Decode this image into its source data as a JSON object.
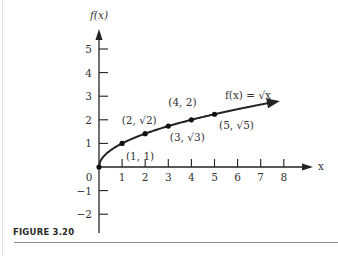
{
  "figure": {
    "caption": "FIGURE 3.20"
  },
  "chart_data": {
    "type": "line",
    "title": "",
    "function_label": "f(x) = √x",
    "xlabel": "x",
    "ylabel": "f(x)",
    "x_ticks": [
      "1",
      "2",
      "3",
      "4",
      "5",
      "6",
      "7",
      "8"
    ],
    "y_ticks": [
      "−2",
      "−1",
      "1",
      "2",
      "3",
      "4",
      "5"
    ],
    "origin_label": "0",
    "xlim": [
      0,
      9
    ],
    "ylim": [
      -3,
      6
    ],
    "grid": false,
    "series": [
      {
        "name": "f(x) = √x",
        "x": [
          0,
          1,
          2,
          3,
          4,
          5
        ],
        "y": [
          0,
          1,
          1.414,
          1.732,
          2,
          2.236
        ]
      }
    ],
    "points": [
      {
        "x": 0,
        "y": 0,
        "label": ""
      },
      {
        "x": 1,
        "y": 1,
        "label": "(1, 1)"
      },
      {
        "x": 2,
        "y": 1.414,
        "label": "(2, √2)"
      },
      {
        "x": 3,
        "y": 1.732,
        "label": "(3, √3)"
      },
      {
        "x": 4,
        "y": 2,
        "label": "(4, 2)"
      },
      {
        "x": 5,
        "y": 2.236,
        "label": "(5, √5)"
      }
    ]
  },
  "colors": {
    "ink": "#222222",
    "text": "#333333",
    "rule": "#8a8a8a"
  }
}
